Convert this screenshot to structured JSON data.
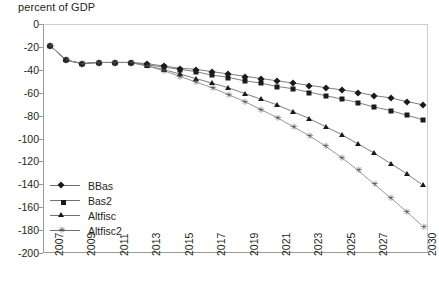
{
  "chart_data": {
    "type": "line",
    "title": "percent of GDP",
    "xlabel": "",
    "ylabel": "",
    "ylim": [
      -200,
      0
    ],
    "yticks": [
      0,
      -20,
      -40,
      -60,
      -80,
      -100,
      -120,
      -140,
      -160,
      -180,
      -200
    ],
    "ytick_labels": [
      "0",
      "-20",
      "-40",
      "-60",
      "-80",
      "-100",
      "-120",
      "-140",
      "-160",
      "-180",
      "-200"
    ],
    "grid": false,
    "legend_position": "inside-lower-left",
    "x": [
      2007,
      2008,
      2009,
      2010,
      2011,
      2012,
      2013,
      2014,
      2015,
      2016,
      2017,
      2018,
      2019,
      2020,
      2021,
      2022,
      2023,
      2024,
      2025,
      2026,
      2027,
      2028,
      2029,
      2030
    ],
    "xtick_labels": [
      "2007",
      "",
      "2009",
      "",
      "2011",
      "",
      "2013",
      "",
      "2015",
      "",
      "2017",
      "",
      "2019",
      "",
      "2021",
      "",
      "2023",
      "",
      "2025",
      "",
      "2027",
      "",
      "",
      "2030"
    ],
    "series": [
      {
        "name": "BBas",
        "marker": "diamond",
        "color": "#1a1a1a",
        "values": [
          -18,
          -31,
          -34,
          -33,
          -33,
          -33,
          -34,
          -36,
          -38,
          -39,
          -41,
          -43,
          -45,
          -47,
          -49,
          -51,
          -53,
          -55,
          -57,
          -59,
          -62,
          -64,
          -67,
          -70
        ]
      },
      {
        "name": "Bas2",
        "marker": "square",
        "color": "#1a1a1a",
        "values": [
          -18,
          -31,
          -34,
          -33,
          -33,
          -33,
          -35,
          -37,
          -39,
          -41,
          -44,
          -46,
          -49,
          -51,
          -54,
          -56,
          -59,
          -62,
          -65,
          -68,
          -72,
          -75,
          -79,
          -83
        ]
      },
      {
        "name": "Altfisc",
        "marker": "triangle",
        "color": "#1a1a1a",
        "values": [
          -18,
          -31,
          -34,
          -33,
          -33,
          -33,
          -36,
          -39,
          -43,
          -47,
          -51,
          -55,
          -60,
          -65,
          -70,
          -76,
          -82,
          -89,
          -96,
          -104,
          -112,
          -121,
          -130,
          -140
        ]
      },
      {
        "name": "Altfisc2",
        "marker": "star",
        "color": "#4a4a4a",
        "values": [
          -18,
          -31,
          -34,
          -33,
          -33,
          -33,
          -36,
          -40,
          -45,
          -50,
          -55,
          -61,
          -67,
          -74,
          -81,
          -89,
          -97,
          -106,
          -116,
          -127,
          -139,
          -151,
          -163,
          -176
        ]
      }
    ]
  },
  "legend": {
    "items": [
      {
        "label": "BBas"
      },
      {
        "label": "Bas2"
      },
      {
        "label": "Altfisc"
      },
      {
        "label": "Altfisc2"
      }
    ]
  }
}
